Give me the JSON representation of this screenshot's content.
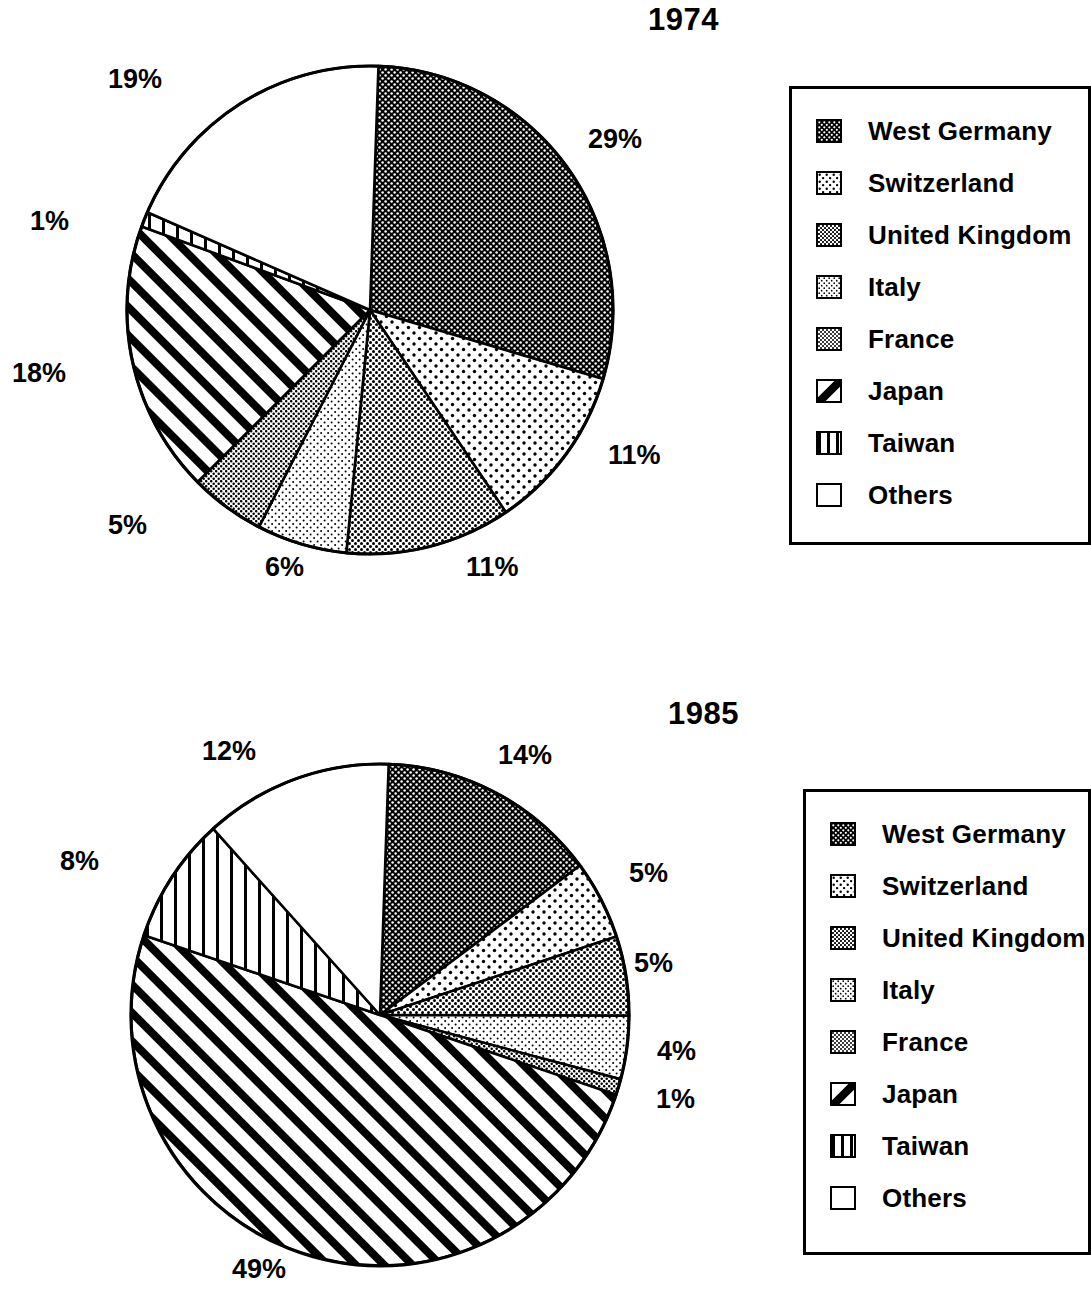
{
  "charts": [
    {
      "title": "1974",
      "labels": [
        {
          "text": "19%",
          "x": 108,
          "y": 64
        },
        {
          "text": "29%",
          "x": 588,
          "y": 124
        },
        {
          "text": "1%",
          "x": 30,
          "y": 206
        },
        {
          "text": "18%",
          "x": 12,
          "y": 358
        },
        {
          "text": "11%",
          "x": 608,
          "y": 440
        },
        {
          "text": "5%",
          "x": 108,
          "y": 510
        },
        {
          "text": "6%",
          "x": 265,
          "y": 552
        },
        {
          "text": "11%",
          "x": 466,
          "y": 552
        }
      ]
    },
    {
      "title": "1985",
      "labels": [
        {
          "text": "12%",
          "x": 202,
          "y": 736
        },
        {
          "text": "14%",
          "x": 498,
          "y": 740
        },
        {
          "text": "8%",
          "x": 60,
          "y": 846
        },
        {
          "text": "5%",
          "x": 629,
          "y": 858
        },
        {
          "text": "5%",
          "x": 634,
          "y": 948
        },
        {
          "text": "4%",
          "x": 657,
          "y": 1036
        },
        {
          "text": "1%",
          "x": 656,
          "y": 1084
        },
        {
          "text": "49%",
          "x": 232,
          "y": 1254
        }
      ]
    }
  ],
  "legend": {
    "items": [
      {
        "label": "West Germany",
        "pattern": "dense-dark-dots",
        "swatch_name": "swatch-west-germany"
      },
      {
        "label": "Switzerland",
        "pattern": "sparse-dots",
        "swatch_name": "swatch-switzerland"
      },
      {
        "label": "United  Kingdom",
        "pattern": "medium-dots",
        "swatch_name": "swatch-united-kingdom"
      },
      {
        "label": "Italy",
        "pattern": "fine-dots",
        "swatch_name": "swatch-italy"
      },
      {
        "label": "France",
        "pattern": "coarse-dots",
        "swatch_name": "swatch-france"
      },
      {
        "label": "Japan",
        "pattern": "diagonal-hatch",
        "swatch_name": "swatch-japan"
      },
      {
        "label": "Taiwan",
        "pattern": "vertical-lines",
        "swatch_name": "swatch-taiwan"
      },
      {
        "label": "Others",
        "pattern": "white",
        "swatch_name": "swatch-others"
      }
    ]
  },
  "chart_data": [
    {
      "type": "pie",
      "title": "1974",
      "categories": [
        "West Germany",
        "Switzerland",
        "United Kingdom",
        "Italy",
        "France",
        "Japan",
        "Taiwan",
        "Others"
      ],
      "values": [
        29,
        11,
        11,
        6,
        5,
        18,
        1,
        19
      ],
      "value_labels": [
        "29%",
        "11%",
        "11%",
        "6%",
        "5%",
        "18%",
        "1%",
        "19%"
      ],
      "units": "percent",
      "start_angle_deg": 0,
      "direction": "clockwise",
      "legend_position": "right"
    },
    {
      "type": "pie",
      "title": "1985",
      "categories": [
        "West Germany",
        "Switzerland",
        "United Kingdom",
        "Italy",
        "France",
        "Japan",
        "Taiwan",
        "Others"
      ],
      "values": [
        14,
        5,
        5,
        4,
        1,
        49,
        8,
        12
      ],
      "value_labels": [
        "14%",
        "5%",
        "5%",
        "4%",
        "1%",
        "49%",
        "8%",
        "12%"
      ],
      "units": "percent",
      "start_angle_deg": 0,
      "direction": "clockwise",
      "legend_position": "right"
    }
  ]
}
